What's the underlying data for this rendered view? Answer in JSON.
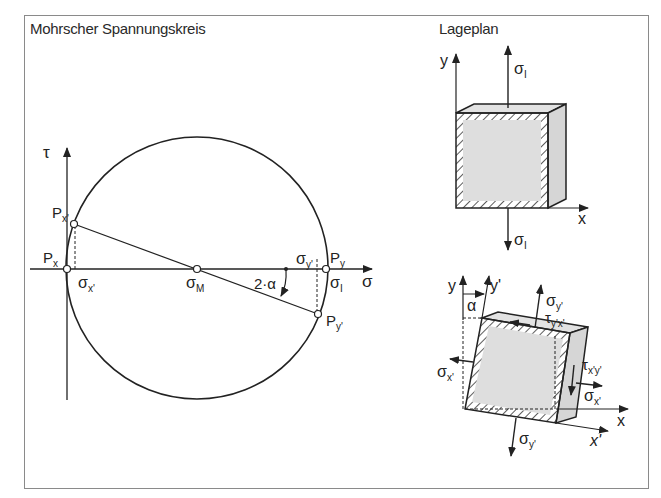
{
  "diagram": {
    "left_panel": {
      "title": "Mohrscher Spannungskreis",
      "axes": {
        "tau_label": "τ",
        "sigma_label": "σ"
      },
      "points": {
        "Px": "P",
        "Px_sub": "x",
        "Pxp": "P",
        "Pxp_sub": "x'",
        "Py": "P",
        "Py_sub": "y",
        "Pyp": "P",
        "Pyp_sub": "y'"
      },
      "labels": {
        "sigma_xp": "σ",
        "sigma_xp_sub": "x'",
        "sigma_M": "σ",
        "sigma_M_sub": "M",
        "sigma_yp": "σ",
        "sigma_yp_sub": "y'",
        "sigma_I": "σ",
        "sigma_I_sub": "I",
        "angle": "2·α"
      }
    },
    "right_panel": {
      "title": "Lageplan",
      "top_element": {
        "y_axis": "y",
        "x_axis": "x",
        "sigma_top": "σ",
        "sigma_top_sub": "I",
        "sigma_bottom": "σ",
        "sigma_bottom_sub": "I"
      },
      "rotated_element": {
        "y_axis": "y",
        "yp_axis": "y'",
        "x_axis": "x",
        "xp_axis": "x'",
        "alpha": "α",
        "sigma_yp_top": "σ",
        "sigma_yp_top_sub": "y'",
        "tau_ypxp": "τ",
        "tau_ypxp_sub": "y'x'",
        "sigma_xp_left": "σ",
        "sigma_xp_left_sub": "x'",
        "tau_xpyp": "τ",
        "tau_xpyp_sub": "x'y'",
        "sigma_xp_right": "σ",
        "sigma_xp_right_sub": "x'",
        "sigma_yp_bottom": "σ",
        "sigma_yp_bottom_sub": "y'"
      }
    },
    "colors": {
      "line": "#2a2a2a",
      "fill": "#dcdcdc",
      "frame": "#8a8a8a"
    }
  }
}
